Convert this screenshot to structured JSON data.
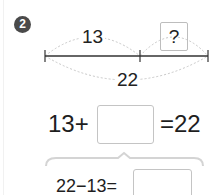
{
  "problem": {
    "number": "2",
    "diagram": {
      "part_label": "13",
      "unknown_label": "?",
      "total_label": "22"
    },
    "equation_main": {
      "left": "13+",
      "right": "=22",
      "blank_value": ""
    },
    "equation_sub": {
      "left": "22−13=",
      "blank_value": ""
    }
  },
  "colors": {
    "badge": "#4a4a4a",
    "line": "#333333",
    "arc": "#c8c8c8",
    "box_border": "#c4c4c4"
  }
}
